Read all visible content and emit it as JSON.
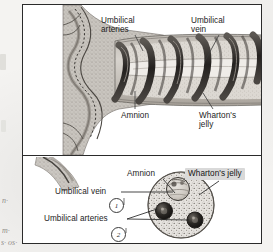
{
  "figure": {
    "panels": [
      {
        "id": "longitudinal",
        "name": "Longitudinal view of umbilical cord at placental insertion",
        "labels": [
          {
            "id": "umbilical-arteries-top",
            "text": "Umbilical\narteries"
          },
          {
            "id": "umbilical-vein-top",
            "text": "Umbilical\nvein"
          },
          {
            "id": "amnion-top",
            "text": "Amnion"
          },
          {
            "id": "whartons-jelly-top",
            "text": "Wharton's\njelly"
          }
        ]
      },
      {
        "id": "cross-section",
        "name": "Cross-section of umbilical cord",
        "labels": [
          {
            "id": "amnion-bottom",
            "text": "Amnion"
          },
          {
            "id": "whartons-jelly-bottom",
            "text": "Wharton's jelly",
            "highlighted": true
          },
          {
            "id": "umbilical-vein-bottom",
            "text": "Umbilical vein"
          },
          {
            "id": "umbilical-arteries-bottom",
            "text": "Umbilical arteries"
          }
        ],
        "annotations": [
          {
            "id": "annotation-1",
            "text": "1"
          },
          {
            "id": "annotation-2",
            "text": "2"
          }
        ],
        "vessels": [
          {
            "id": "vein",
            "label": "Umbilical vein",
            "count": 1,
            "shade": "light"
          },
          {
            "id": "artery-left",
            "label": "Umbilical artery",
            "count": 1,
            "shade": "dark"
          },
          {
            "id": "artery-right",
            "label": "Umbilical artery",
            "count": 1,
            "shade": "dark"
          }
        ]
      }
    ],
    "margin_notes": [
      {
        "id": "margin-note-1",
        "text": "n·"
      },
      {
        "id": "margin-note-2",
        "text": "m·"
      },
      {
        "id": "margin-note-3",
        "text": "s· os·"
      }
    ],
    "colors": {
      "border": "#2b2b2b",
      "page": "#f4f3f1",
      "plate": "#ffffff",
      "label_text": "#1d1d1d",
      "highlight": "#d9d9d9",
      "jelly_fill": "#cfcbc6",
      "vessel_dark": "#2e2b29",
      "vessel_light": "#b8b4ae"
    }
  }
}
